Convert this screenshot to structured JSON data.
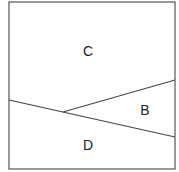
{
  "diagram": {
    "type": "region-partition",
    "box": {
      "x": 9,
      "y": 2,
      "width": 166,
      "height": 167,
      "stroke": "#555555"
    },
    "lines": [
      {
        "name": "lower-dividing-line",
        "x1": 9,
        "y1": 100,
        "x2": 175,
        "y2": 137,
        "stroke": "#444444"
      },
      {
        "name": "upper-dividing-line",
        "x1": 63,
        "y1": 112,
        "x2": 175,
        "y2": 80,
        "stroke": "#444444"
      }
    ],
    "regions": [
      {
        "label": "C",
        "x": 88,
        "y": 56
      },
      {
        "label": "B",
        "x": 145,
        "y": 115
      },
      {
        "label": "D",
        "x": 88,
        "y": 150
      }
    ]
  }
}
